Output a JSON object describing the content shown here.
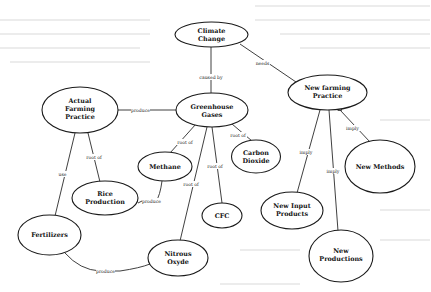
{
  "diagram": {
    "nodes": {
      "climate_change": {
        "line1": "Climate",
        "line2": "Change"
      },
      "greenhouse_gases": {
        "line1": "Greenhouse",
        "line2": "Gases"
      },
      "actual_farming_practice": {
        "line1": "Actual",
        "line2": "Farming",
        "line3": "Practice"
      },
      "new_farming_practice": {
        "line1": "New farming",
        "line2": "Practice"
      },
      "methane": {
        "line1": "Methane"
      },
      "carbon_dioxide": {
        "line1": "Carbon",
        "line2": "Dioxide"
      },
      "cfc": {
        "line1": "CFC"
      },
      "rice_production": {
        "line1": "Rice",
        "line2": "Production"
      },
      "fertilizers": {
        "line1": "Fertilizers"
      },
      "nitrous_oxide": {
        "line1": "Nitrous",
        "line2": "Oxyde"
      },
      "new_methods": {
        "line1": "New Methods"
      },
      "new_input_products": {
        "line1": "New Input",
        "line2": "Products"
      },
      "new_productions": {
        "line1": "New",
        "line2": "Productions"
      }
    },
    "edges": {
      "climate_greenhouse": "caused by",
      "climate_newfarming": "needs",
      "actual_greenhouse": "produce",
      "greenhouse_methane": "root of",
      "greenhouse_co2": "root of",
      "greenhouse_cfc": "root of",
      "greenhouse_nitrous": "root of",
      "actual_rice": "root of",
      "actual_fertilizers": "use",
      "rice_methane": "produce",
      "fertilizers_nitrous": "produce",
      "newfarming_newmethods": "imply",
      "newfarming_newinput": "imply",
      "newfarming_newproductions": "imply"
    }
  }
}
